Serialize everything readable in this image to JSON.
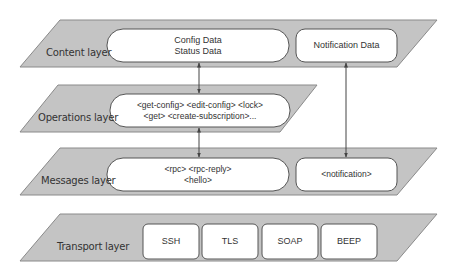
{
  "colors": {
    "layer_fill": "#c4c4c4",
    "layer_stroke": "#8a8a8a",
    "box_fill": "#ffffff",
    "box_stroke": "#555555",
    "text": "#333333",
    "arrow": "#444444"
  },
  "layers": [
    {
      "name": "Content layer",
      "boxes": [
        {
          "lines": [
            "Config Data",
            "Status Data"
          ],
          "shape": "pill"
        },
        {
          "lines": [
            "Notification Data"
          ],
          "shape": "rounded"
        }
      ]
    },
    {
      "name": "Operations layer",
      "boxes": [
        {
          "lines": [
            "<get-config> <edit-config> <lock>",
            "<get>  <create-subscription>..."
          ],
          "shape": "pill"
        }
      ]
    },
    {
      "name": "Messages layer",
      "boxes": [
        {
          "lines": [
            "<rpc> <rpc-reply>",
            "<hello>"
          ],
          "shape": "pill"
        },
        {
          "lines": [
            "<notification>"
          ],
          "shape": "rounded"
        }
      ]
    },
    {
      "name": "Transport layer",
      "boxes": [
        {
          "lines": [
            "SSH"
          ],
          "shape": "rounded"
        },
        {
          "lines": [
            "TLS"
          ],
          "shape": "rounded"
        },
        {
          "lines": [
            "SOAP"
          ],
          "shape": "rounded"
        },
        {
          "lines": [
            "BEEP"
          ],
          "shape": "rounded"
        }
      ]
    }
  ],
  "connections": [
    {
      "from": "Config Data / Status Data",
      "to": "Operations",
      "bidirectional": true
    },
    {
      "from": "Operations",
      "to": "<rpc> <rpc-reply> <hello>",
      "bidirectional": true
    },
    {
      "from": "Notification Data",
      "to": "<notification>",
      "bidirectional": true
    }
  ]
}
